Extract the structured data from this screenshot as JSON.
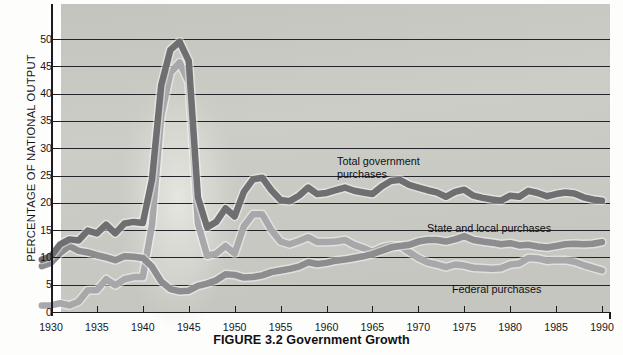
{
  "figure": {
    "caption": "FIGURE 3.2  Government Growth",
    "caption_number": "FIGURE 3.2",
    "caption_title": "Government Growth"
  },
  "axes": {
    "y_title": "PERCENTAGE OF NATIONAL OUTPUT",
    "y_ticks": [
      "0",
      "5",
      "10",
      "15",
      "20",
      "25",
      "30",
      "35",
      "40",
      "45",
      "50"
    ],
    "x_ticks": [
      "1930",
      "1935",
      "1940",
      "1945",
      "1950",
      "1955",
      "1960",
      "1965",
      "1970",
      "1975",
      "1980",
      "1985",
      "1990"
    ]
  },
  "annotations": {
    "total": "Total government\npurchases",
    "state_local": "State and local purchases",
    "federal": "Federal purchases"
  },
  "colors": {
    "plot_background": "#c9c9c4",
    "gridline": "#24242a",
    "band_total": "#6f6f72",
    "band_state_local": "#8d8d90",
    "band_federal": "#a8a8ab",
    "axis": "#1c1c20",
    "text": "#101014"
  },
  "chart_data": {
    "type": "area",
    "title": "FIGURE 3.2  Government Growth",
    "xlabel": "",
    "ylabel": "PERCENTAGE OF NATIONAL OUTPUT",
    "xlim": [
      1929,
      1990
    ],
    "ylim": [
      0,
      53
    ],
    "ytick_values": [
      0,
      5,
      10,
      15,
      20,
      25,
      30,
      35,
      40,
      45,
      50
    ],
    "xtick_values": [
      1930,
      1935,
      1940,
      1945,
      1950,
      1955,
      1960,
      1965,
      1970,
      1975,
      1980,
      1985,
      1990
    ],
    "grid": "horizontal",
    "legend": "inline-annotations",
    "x": [
      1929,
      1930,
      1931,
      1932,
      1933,
      1934,
      1935,
      1936,
      1937,
      1938,
      1939,
      1940,
      1941,
      1942,
      1943,
      1944,
      1945,
      1946,
      1947,
      1948,
      1949,
      1950,
      1951,
      1952,
      1953,
      1954,
      1955,
      1956,
      1957,
      1958,
      1959,
      1960,
      1961,
      1962,
      1963,
      1964,
      1965,
      1966,
      1967,
      1968,
      1969,
      1970,
      1971,
      1972,
      1973,
      1974,
      1975,
      1976,
      1977,
      1978,
      1979,
      1980,
      1981,
      1982,
      1983,
      1984,
      1985,
      1986,
      1987,
      1988,
      1989,
      1990
    ],
    "series": [
      {
        "name": "Total government purchases",
        "label": "Total government\npurchases",
        "color": "#6f6f72",
        "values": [
          9.6,
          10.2,
          12.4,
          13.3,
          13.1,
          14.9,
          14.4,
          16.0,
          14.4,
          16.2,
          16.5,
          16.3,
          24.3,
          41.5,
          48.0,
          49.5,
          46.0,
          21.0,
          15.5,
          16.5,
          19.0,
          17.5,
          22.0,
          24.3,
          24.6,
          22.3,
          20.5,
          20.3,
          21.3,
          22.8,
          21.6,
          21.8,
          22.3,
          22.8,
          22.2,
          21.9,
          21.6,
          23.0,
          24.0,
          24.2,
          23.3,
          22.8,
          22.3,
          21.9,
          21.1,
          22.0,
          22.4,
          21.3,
          20.9,
          20.6,
          20.4,
          21.3,
          21.1,
          22.2,
          21.8,
          21.2,
          21.6,
          21.9,
          21.7,
          21.0,
          20.6,
          20.4
        ]
      },
      {
        "name": "State and local purchases",
        "label": "State and local purchases",
        "color": "#8d8d90",
        "values": [
          8.4,
          9.0,
          10.8,
          12.1,
          11.2,
          10.9,
          10.4,
          10.0,
          9.5,
          10.2,
          10.1,
          9.9,
          8.3,
          5.6,
          4.2,
          3.8,
          3.9,
          4.8,
          5.2,
          5.8,
          6.9,
          6.8,
          6.3,
          6.4,
          6.7,
          7.3,
          7.6,
          7.9,
          8.3,
          9.1,
          8.8,
          9.0,
          9.4,
          9.6,
          9.9,
          10.2,
          10.6,
          11.2,
          11.8,
          12.1,
          12.3,
          12.9,
          13.2,
          13.2,
          12.9,
          13.3,
          13.9,
          13.2,
          12.9,
          12.7,
          12.4,
          12.6,
          12.2,
          12.3,
          12.0,
          11.8,
          12.1,
          12.4,
          12.5,
          12.4,
          12.5,
          12.8
        ]
      },
      {
        "name": "Federal purchases",
        "label": "Federal purchases",
        "color": "#a8a8ab",
        "values": [
          1.2,
          1.2,
          1.6,
          1.2,
          1.9,
          4.0,
          4.0,
          6.0,
          4.9,
          6.0,
          6.4,
          6.4,
          16.0,
          35.9,
          43.8,
          45.7,
          42.1,
          16.2,
          10.3,
          10.7,
          12.1,
          10.7,
          15.7,
          17.9,
          17.9,
          15.0,
          12.9,
          12.4,
          13.0,
          13.7,
          12.8,
          12.8,
          12.9,
          13.2,
          12.3,
          11.7,
          11.0,
          11.8,
          12.2,
          12.1,
          11.0,
          9.9,
          9.1,
          8.7,
          8.2,
          8.7,
          8.5,
          8.1,
          8.0,
          7.9,
          8.0,
          8.7,
          8.9,
          9.9,
          9.8,
          9.4,
          9.5,
          9.5,
          9.2,
          8.6,
          8.1,
          7.6
        ]
      }
    ]
  }
}
